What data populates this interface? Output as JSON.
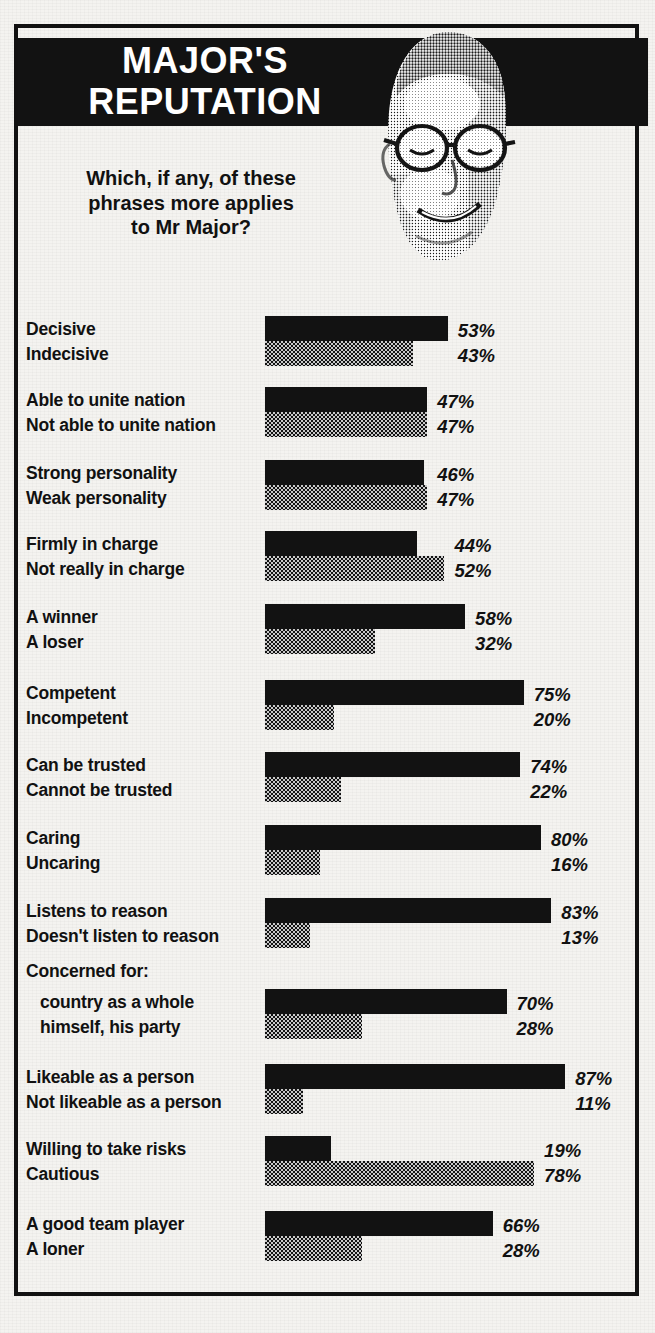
{
  "header": {
    "title_line1": "MAJOR'S",
    "title_line2": "REPUTATION",
    "title": "MAJOR'S\nREPUTATION",
    "photo_alt": "portrait-photo-john-major"
  },
  "question": "Which, if any, of these\nphrases more applies\nto Mr Major?",
  "colors": {
    "banner_background": "#121212",
    "positive_bar": "#121212",
    "negative_bar": "#2a2a2a",
    "paper": "#f4f3f0",
    "text": "#111111",
    "banner_text": "#ffffff"
  },
  "chart_data": {
    "type": "bar",
    "orientation": "horizontal",
    "title": "MAJOR'S REPUTATION",
    "subtitle": "Which, if any, of these phrases more applies to Mr Major?",
    "xlabel": "",
    "ylabel": "",
    "xlim": [
      0,
      100
    ],
    "grid": false,
    "legend_position": "none",
    "value_suffix": "%",
    "series": [
      {
        "name": "positive",
        "style": "solid"
      },
      {
        "name": "negative",
        "style": "dotted"
      }
    ],
    "groups": [
      {
        "positive_label": "Decisive",
        "negative_label": "Indecisive",
        "positive_value": 53,
        "negative_value": 43,
        "positive_value_text": "53%",
        "negative_value_text": "43%"
      },
      {
        "positive_label": "Able to unite nation",
        "negative_label": "Not able to unite nation",
        "positive_value": 47,
        "negative_value": 47,
        "positive_value_text": "47%",
        "negative_value_text": "47%"
      },
      {
        "positive_label": "Strong personality",
        "negative_label": "Weak personality",
        "positive_value": 46,
        "negative_value": 47,
        "positive_value_text": "46%",
        "negative_value_text": "47%"
      },
      {
        "positive_label": "Firmly in charge",
        "negative_label": "Not really in charge",
        "positive_value": 44,
        "negative_value": 52,
        "positive_value_text": "44%",
        "negative_value_text": "52%"
      },
      {
        "positive_label": "A winner",
        "negative_label": "A loser",
        "positive_value": 58,
        "negative_value": 32,
        "positive_value_text": "58%",
        "negative_value_text": "32%"
      },
      {
        "positive_label": "Competent",
        "negative_label": "Incompetent",
        "positive_value": 75,
        "negative_value": 20,
        "positive_value_text": "75%",
        "negative_value_text": "20%"
      },
      {
        "positive_label": "Can be trusted",
        "negative_label": "Cannot be trusted",
        "positive_value": 74,
        "negative_value": 22,
        "positive_value_text": "74%",
        "negative_value_text": "22%"
      },
      {
        "positive_label": "Caring",
        "negative_label": "Uncaring",
        "positive_value": 80,
        "negative_value": 16,
        "positive_value_text": "80%",
        "negative_value_text": "16%"
      },
      {
        "positive_label": "Listens to reason",
        "negative_label": "Doesn't listen to reason",
        "positive_value": 83,
        "negative_value": 13,
        "positive_value_text": "83%",
        "negative_value_text": "13%"
      },
      {
        "group_heading": "Concerned for:",
        "positive_label": "country as a whole",
        "negative_label": "himself, his party",
        "positive_value": 70,
        "negative_value": 28,
        "positive_value_text": "70%",
        "negative_value_text": "28%"
      },
      {
        "positive_label": "Likeable as a person",
        "negative_label": "Not likeable as a person",
        "positive_value": 87,
        "negative_value": 11,
        "positive_value_text": "87%",
        "negative_value_text": "11%"
      },
      {
        "positive_label": "Willing to take risks",
        "negative_label": "Cautious",
        "positive_value": 19,
        "negative_value": 78,
        "positive_value_text": "19%",
        "negative_value_text": "78%"
      },
      {
        "positive_label": "A good team player",
        "negative_label": "A loner",
        "positive_value": 66,
        "negative_value": 28,
        "positive_value_text": "66%",
        "negative_value_text": "28%"
      }
    ]
  }
}
